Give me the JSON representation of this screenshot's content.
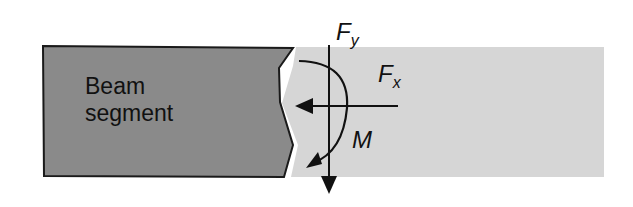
{
  "diagram": {
    "segment_label_line1": "Beam",
    "segment_label_line2": "segment",
    "force_y": {
      "symbol": "F",
      "subscript": "y"
    },
    "force_x": {
      "symbol": "F",
      "subscript": "x"
    },
    "moment": "M",
    "colors": {
      "segment_fill": "#8a8a8a",
      "section_fill": "#d6d6d6",
      "outline": "#1a1a1a",
      "background": "#ffffff"
    }
  }
}
